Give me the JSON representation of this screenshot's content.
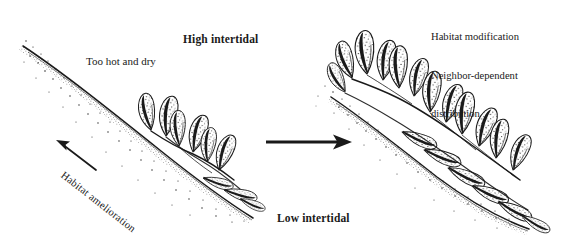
{
  "figure": {
    "type": "scientific-line-art-diagram",
    "background_color": "#ffffff",
    "ink_color": "#1a1a1a",
    "width": 571,
    "height": 251
  },
  "labels": {
    "high_intertidal": "High intertidal",
    "too_hot_and_dry": "Too hot and dry",
    "low_intertidal": "Low intertidal",
    "habitat_amelioration": "Habitat amelioration",
    "right_notes_line1": "Habitat modification",
    "right_notes_line2": "Neighbor-dependent",
    "right_notes_line3": "distribution"
  },
  "arrows": {
    "transition_arrow": "right-arrow",
    "amelioration_arrow": "up-left-arrow"
  },
  "panels": {
    "left": {
      "name": "sparse-cluster-panel",
      "description": "Small sparse cluster of stippled leafy fronds on a steep stippled substrate slope",
      "plant_count": 9
    },
    "right": {
      "name": "dense-cluster-panel",
      "description": "Large dense cluster of stippled leafy fronds spreading along the substrate slope",
      "plant_count": 18
    }
  }
}
